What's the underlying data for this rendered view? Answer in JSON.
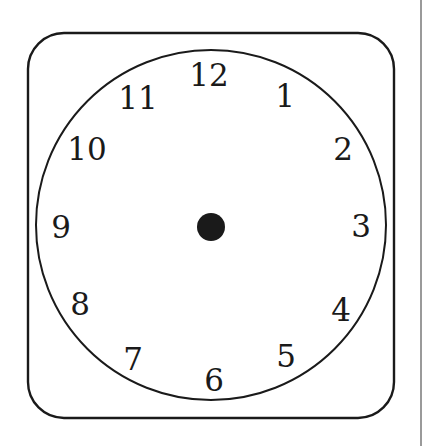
{
  "figure": {
    "type": "clock-face",
    "frame": {
      "shape": "rounded-rectangle",
      "x": 28,
      "y": 33,
      "width": 366,
      "height": 385,
      "corner_radius": 36,
      "stroke": "#1a1a1a"
    },
    "dial": {
      "shape": "circle",
      "cx": 211,
      "cy": 225,
      "r": 175,
      "stroke": "#1a1a1a"
    },
    "center_dot": {
      "cx": 211,
      "cy": 227,
      "r": 14,
      "fill": "#1a1a1a"
    },
    "numerals": [
      {
        "label": "12",
        "x": 209,
        "y": 75
      },
      {
        "label": "1",
        "x": 285,
        "y": 96
      },
      {
        "label": "2",
        "x": 343,
        "y": 149
      },
      {
        "label": "3",
        "x": 361,
        "y": 226
      },
      {
        "label": "4",
        "x": 341,
        "y": 310
      },
      {
        "label": "5",
        "x": 286,
        "y": 356
      },
      {
        "label": "6",
        "x": 214,
        "y": 380
      },
      {
        "label": "7",
        "x": 133,
        "y": 359
      },
      {
        "label": "8",
        "x": 80,
        "y": 304
      },
      {
        "label": "9",
        "x": 61,
        "y": 227
      },
      {
        "label": "10",
        "x": 87,
        "y": 149
      },
      {
        "label": "11",
        "x": 138,
        "y": 98
      }
    ]
  }
}
